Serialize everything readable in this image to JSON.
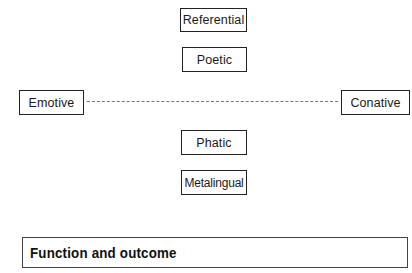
{
  "diagram": {
    "nodes": {
      "referential": "Referential",
      "poetic": "Poetic",
      "emotive": "Emotive",
      "conative": "Conative",
      "phatic": "Phatic",
      "metalingual": "Metalingual"
    },
    "connector": {
      "from": "Emotive",
      "to": "Conative",
      "style": "dashed",
      "color": "#777777"
    }
  },
  "footer": {
    "title": "Function and outcome"
  }
}
